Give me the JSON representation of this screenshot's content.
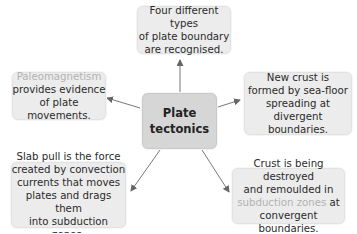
{
  "center": {
    "line1": "Plate",
    "line2": "tectonics"
  },
  "nodes": {
    "top": {
      "lines": [
        "Four different types",
        "of plate boundary",
        "are recognised."
      ]
    },
    "left": {
      "faded": "Paleomagnetism",
      "lines": [
        "provides evidence",
        "of plate movements."
      ]
    },
    "right": {
      "lines": [
        "New crust is",
        "formed by sea-floor",
        "spreading at divergent",
        "boundaries."
      ]
    },
    "bottom_left": {
      "lines": [
        "Slab pull is the force",
        "created by convection",
        "currents that moves",
        "plates and drags them",
        "into subduction zones."
      ]
    },
    "bottom_right": {
      "lines": [
        "Crust is being destroyed",
        "and remoulded in"
      ],
      "faded": "subduction zones",
      "after_faded": " at",
      "last": "convergent boundaries."
    }
  },
  "colors": {
    "box": "#ececec",
    "center": "#d6d6d6",
    "arrow": "#666666",
    "faded_text": "#b3b3b3"
  }
}
